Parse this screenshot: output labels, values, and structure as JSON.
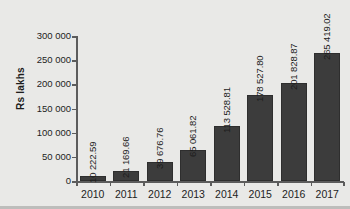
{
  "chart_data": {
    "type": "bar",
    "title": "",
    "subtitle": "",
    "xlabel": "",
    "ylabel": "Rs lakhs",
    "categories": [
      "2010",
      "2011",
      "2012",
      "2013",
      "2014",
      "2015",
      "2016",
      "2017"
    ],
    "values": [
      10222.59,
      21169.66,
      39676.76,
      65061.82,
      113528.81,
      178527.8,
      201828.87,
      265419.02
    ],
    "value_labels": [
      "10 222.59",
      "21 169.66",
      "39 676.76",
      "65 061.82",
      "113 528.81",
      "178 527.80",
      "201 828.87",
      "265 419.02"
    ],
    "ylim": [
      0,
      300000
    ],
    "y_ticks": [
      0,
      50000,
      100000,
      150000,
      200000,
      250000,
      300000
    ],
    "y_tick_labels": [
      "0",
      "50 000",
      "100 000",
      "150 000",
      "200 000",
      "250 000",
      "300 000"
    ],
    "grid": false,
    "legend": false,
    "legend_position": "none",
    "series": [
      {
        "name": "Rs lakhs",
        "values": [
          10222.59,
          21169.66,
          39676.76,
          65061.82,
          113528.81,
          178527.8,
          201828.87,
          265419.02
        ]
      }
    ],
    "colors": {
      "bar_fill": "#3c3c3c",
      "bar_stroke": "#2e2e2e",
      "axis": "#5c5c5c",
      "text": "#1d1d1d",
      "background": "#e9e9e7"
    },
    "value_label_rotation": 90,
    "value_label_position": "outside-top"
  }
}
